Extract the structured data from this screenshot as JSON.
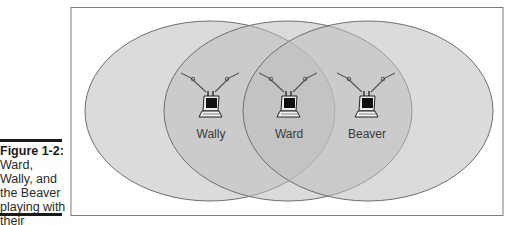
{
  "caption": {
    "label": "Figure 1-2:",
    "lines": [
      "Ward,",
      "Wally, and",
      "the Beaver",
      "playing with",
      "their",
      "wireless",
      "network."
    ]
  },
  "diagram": {
    "nodes": [
      {
        "name": "Wally",
        "cx": 211,
        "cy": 122
      },
      {
        "name": "Ward",
        "cx": 288,
        "cy": 122
      },
      {
        "name": "Beaver",
        "cx": 367,
        "cy": 122
      }
    ],
    "colors": {
      "ellipse_fill": "#c9c9c9",
      "ellipse_stroke": "#6e6e6e",
      "frame": "#7a7a7a",
      "label": "#3a3a3a"
    }
  }
}
